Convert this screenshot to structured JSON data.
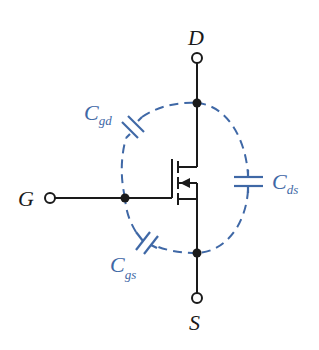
{
  "diagram": {
    "type": "mosfet-parasitic-capacitance",
    "colors": {
      "wire": "#1a1a1a",
      "parasitic": "#3f68a6",
      "background": "#ffffff"
    },
    "terminals": {
      "drain": {
        "label": "D"
      },
      "gate": {
        "label": "G"
      },
      "source": {
        "label": "S"
      }
    },
    "capacitors": {
      "gd": {
        "main": "C",
        "sub": "gd"
      },
      "ds": {
        "main": "C",
        "sub": "ds"
      },
      "gs": {
        "main": "C",
        "sub": "gs"
      }
    }
  }
}
